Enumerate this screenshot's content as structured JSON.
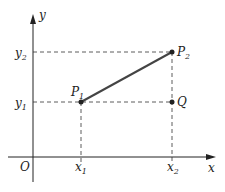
{
  "diagram": {
    "axes": {
      "x_label": "x",
      "y_label": "y",
      "origin_label": "O"
    },
    "ticks": {
      "x1": {
        "base": "x",
        "sub": "1"
      },
      "x2": {
        "base": "x",
        "sub": "2"
      },
      "y1": {
        "base": "y",
        "sub": "1"
      },
      "y2": {
        "base": "y",
        "sub": "2"
      }
    },
    "points": {
      "P1": {
        "base": "P",
        "sub": "1"
      },
      "P2": {
        "base": "P",
        "sub": "2"
      },
      "Q": {
        "base": "Q",
        "sub": ""
      }
    },
    "colors": {
      "stroke": "#222222",
      "segment": "#444444"
    }
  }
}
